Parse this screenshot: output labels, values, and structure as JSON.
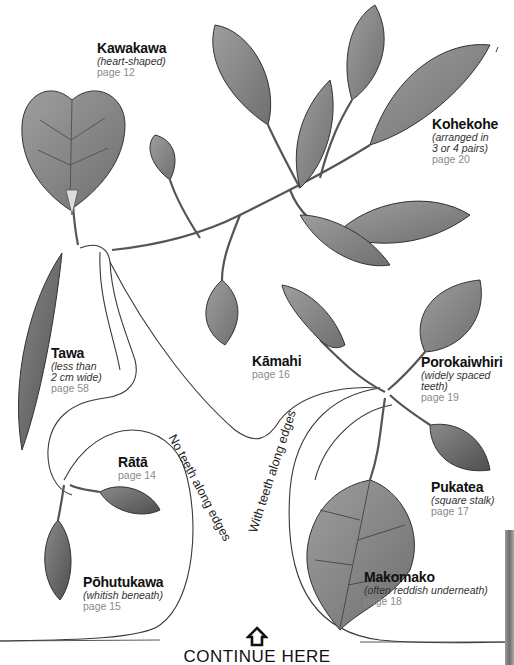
{
  "species": [
    {
      "name": "Kawakawa",
      "note": "(heart-shaped)",
      "page": "page 12"
    },
    {
      "name": "Kohekohe",
      "note": "(arranged in 3 or 4 pairs)",
      "note_line1": "(arranged in",
      "note_line2": "3 or 4 pairs)",
      "page": "page 20"
    },
    {
      "name": "Tawa",
      "note_line1": "(less than",
      "note_line2": "2 cm wide)",
      "page": "page 58"
    },
    {
      "name": "Kāmahi",
      "page": "page 16"
    },
    {
      "name": "Porokaiwhiri",
      "note": "(widely spaced teeth)",
      "page": "page 19"
    },
    {
      "name": "Rātā",
      "page": "page 14"
    },
    {
      "name": "Pukatea",
      "note": "(square stalk)",
      "page": "page 17"
    },
    {
      "name": "Makomako",
      "note": "(often reddish underneath)",
      "page": "page 18"
    },
    {
      "name": "Pōhutukawa",
      "note": "(whitish beneath)",
      "page": "page 15"
    }
  ],
  "branches": {
    "no_teeth": "No teeth along edges",
    "with_teeth": "With teeth along edges"
  },
  "footer": {
    "continue_label": "CONTINUE HERE",
    "arrow_icon": "home-arrow-up-icon"
  },
  "colors": {
    "leaf_fill": "#8c8c8c",
    "leaf_dark": "#5a5a5a",
    "outline": "#3a3a3a",
    "page_text": "#8a8a8a"
  }
}
